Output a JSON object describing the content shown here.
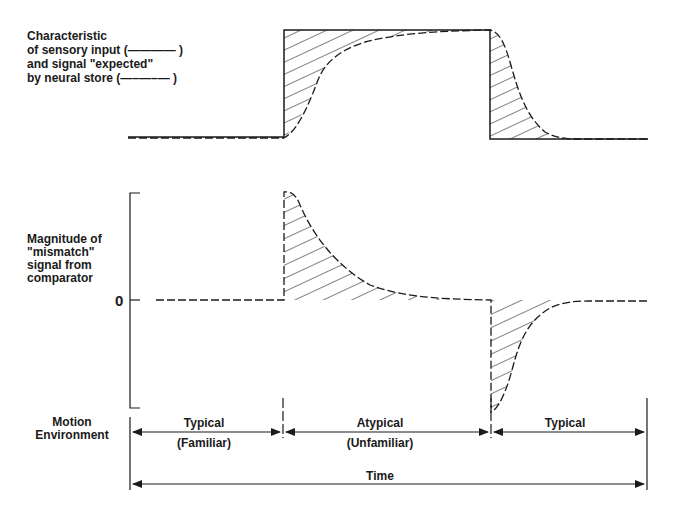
{
  "top_panel": {
    "label_lines": [
      "Characteristic",
      "of sensory input (———— )",
      "and signal \"expected\"",
      "by neural store (—–—–— )"
    ],
    "legend": {
      "solid": "sensory input",
      "dashed": "signal expected by neural store"
    }
  },
  "bottom_panel": {
    "label_lines": [
      "Magnitude of",
      "\"mismatch\"",
      "signal from",
      "comparator"
    ],
    "zero_label": "0"
  },
  "timeline": {
    "row_label_lines": [
      "Motion",
      "Environment"
    ],
    "segments": [
      {
        "title": "Typical",
        "subtitle": "(Familiar)"
      },
      {
        "title": "Atypical",
        "subtitle": "(Unfamiliar)"
      },
      {
        "title": "Typical",
        "subtitle": ""
      }
    ],
    "axis_label": "Time"
  },
  "colors": {
    "ink": "#1a1a1a",
    "background": "#ffffff"
  }
}
